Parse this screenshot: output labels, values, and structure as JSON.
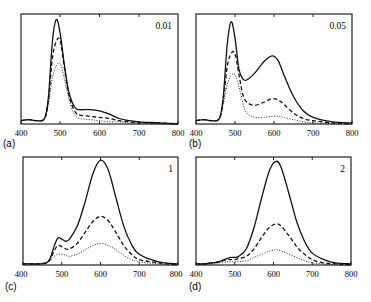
{
  "figure": {
    "panels": [
      {
        "id": "a",
        "label": "(a)",
        "annotation": "0.01"
      },
      {
        "id": "b",
        "label": "(b)",
        "annotation": "0.05"
      },
      {
        "id": "c",
        "label": "(c)",
        "annotation": "1"
      },
      {
        "id": "d",
        "label": "(d)",
        "annotation": "2"
      }
    ],
    "x_ticks": [
      "400",
      "500",
      "600",
      "700",
      "800"
    ]
  },
  "chart_data": [
    {
      "type": "line",
      "panel": "(a)",
      "title": "0.01",
      "xlabel": "",
      "ylabel": "",
      "xlim": [
        400,
        800
      ],
      "ylim": [
        0,
        1
      ],
      "x_ticks": [
        400,
        500,
        600,
        700,
        800
      ],
      "grid": false,
      "x": [
        400,
        420,
        440,
        460,
        470,
        480,
        490,
        500,
        510,
        520,
        530,
        540,
        550,
        575,
        600,
        625,
        650,
        675,
        700,
        750,
        800
      ],
      "series": [
        {
          "name": "solid",
          "style": "solid",
          "values": [
            0.03,
            0.04,
            0.03,
            0.05,
            0.25,
            0.75,
            0.95,
            0.82,
            0.55,
            0.32,
            0.2,
            0.14,
            0.13,
            0.13,
            0.12,
            0.09,
            0.05,
            0.03,
            0.02,
            0.01,
            0.0
          ]
        },
        {
          "name": "dashed",
          "style": "dashed",
          "values": [
            0.03,
            0.04,
            0.03,
            0.05,
            0.22,
            0.6,
            0.75,
            0.76,
            0.52,
            0.3,
            0.17,
            0.1,
            0.08,
            0.07,
            0.06,
            0.05,
            0.03,
            0.02,
            0.01,
            0.01,
            0.0
          ]
        },
        {
          "name": "dotted",
          "style": "dotted",
          "values": [
            0.03,
            0.04,
            0.03,
            0.05,
            0.18,
            0.42,
            0.53,
            0.55,
            0.42,
            0.26,
            0.13,
            0.07,
            0.05,
            0.04,
            0.03,
            0.02,
            0.02,
            0.01,
            0.01,
            0.0,
            0.0
          ]
        }
      ]
    },
    {
      "type": "line",
      "panel": "(b)",
      "title": "0.05",
      "xlabel": "",
      "ylabel": "",
      "xlim": [
        400,
        800
      ],
      "ylim": [
        0,
        1
      ],
      "x_ticks": [
        400,
        500,
        600,
        700,
        800
      ],
      "grid": false,
      "x": [
        400,
        420,
        440,
        460,
        470,
        480,
        490,
        500,
        510,
        520,
        530,
        550,
        575,
        595,
        610,
        625,
        650,
        675,
        700,
        750,
        800
      ],
      "series": [
        {
          "name": "solid",
          "style": "solid",
          "values": [
            0.03,
            0.04,
            0.03,
            0.05,
            0.25,
            0.72,
            0.93,
            0.78,
            0.5,
            0.41,
            0.4,
            0.46,
            0.57,
            0.62,
            0.58,
            0.45,
            0.25,
            0.12,
            0.06,
            0.02,
            0.01
          ]
        },
        {
          "name": "dashed",
          "style": "dashed",
          "values": [
            0.03,
            0.04,
            0.03,
            0.05,
            0.22,
            0.52,
            0.64,
            0.64,
            0.45,
            0.27,
            0.2,
            0.17,
            0.2,
            0.23,
            0.22,
            0.18,
            0.1,
            0.05,
            0.03,
            0.01,
            0.0
          ]
        },
        {
          "name": "dotted",
          "style": "dotted",
          "values": [
            0.03,
            0.04,
            0.03,
            0.05,
            0.18,
            0.36,
            0.44,
            0.45,
            0.34,
            0.19,
            0.1,
            0.06,
            0.06,
            0.07,
            0.07,
            0.06,
            0.04,
            0.02,
            0.01,
            0.0,
            0.0
          ]
        }
      ]
    },
    {
      "type": "line",
      "panel": "(c)",
      "title": "1",
      "xlabel": "",
      "ylabel": "",
      "xlim": [
        400,
        800
      ],
      "ylim": [
        0,
        1
      ],
      "x_ticks": [
        400,
        500,
        600,
        700,
        800
      ],
      "grid": false,
      "x": [
        400,
        420,
        440,
        460,
        470,
        480,
        490,
        500,
        510,
        520,
        540,
        560,
        580,
        600,
        620,
        640,
        660,
        680,
        700,
        750,
        800
      ],
      "series": [
        {
          "name": "solid",
          "style": "solid",
          "values": [
            0.01,
            0.01,
            0.01,
            0.02,
            0.06,
            0.17,
            0.25,
            0.24,
            0.22,
            0.24,
            0.36,
            0.58,
            0.84,
            0.97,
            0.88,
            0.62,
            0.36,
            0.19,
            0.1,
            0.03,
            0.01
          ]
        },
        {
          "name": "dashed",
          "style": "dashed",
          "values": [
            0.01,
            0.01,
            0.01,
            0.02,
            0.05,
            0.13,
            0.18,
            0.17,
            0.15,
            0.15,
            0.2,
            0.3,
            0.4,
            0.45,
            0.41,
            0.3,
            0.18,
            0.1,
            0.05,
            0.02,
            0.0
          ]
        },
        {
          "name": "dotted",
          "style": "dotted",
          "values": [
            0.01,
            0.01,
            0.01,
            0.02,
            0.04,
            0.08,
            0.1,
            0.1,
            0.09,
            0.08,
            0.1,
            0.14,
            0.18,
            0.2,
            0.18,
            0.14,
            0.09,
            0.05,
            0.03,
            0.01,
            0.0
          ]
        }
      ]
    },
    {
      "type": "line",
      "panel": "(d)",
      "title": "2",
      "xlabel": "",
      "ylabel": "",
      "xlim": [
        400,
        800
      ],
      "ylim": [
        0,
        1
      ],
      "x_ticks": [
        400,
        500,
        600,
        700,
        800
      ],
      "grid": false,
      "x": [
        400,
        420,
        440,
        460,
        480,
        490,
        500,
        510,
        530,
        550,
        570,
        590,
        607,
        620,
        640,
        660,
        680,
        700,
        730,
        760,
        800
      ],
      "series": [
        {
          "name": "solid",
          "style": "solid",
          "values": [
            0.01,
            0.01,
            0.02,
            0.03,
            0.06,
            0.07,
            0.07,
            0.08,
            0.15,
            0.35,
            0.63,
            0.88,
            0.96,
            0.9,
            0.66,
            0.4,
            0.22,
            0.11,
            0.05,
            0.02,
            0.01
          ]
        },
        {
          "name": "dashed",
          "style": "dashed",
          "values": [
            0.01,
            0.01,
            0.02,
            0.03,
            0.05,
            0.05,
            0.05,
            0.06,
            0.08,
            0.15,
            0.26,
            0.35,
            0.38,
            0.36,
            0.27,
            0.17,
            0.1,
            0.05,
            0.02,
            0.01,
            0.0
          ]
        },
        {
          "name": "dotted",
          "style": "dotted",
          "values": [
            0.01,
            0.01,
            0.01,
            0.02,
            0.03,
            0.03,
            0.03,
            0.03,
            0.04,
            0.07,
            0.1,
            0.13,
            0.14,
            0.13,
            0.1,
            0.07,
            0.04,
            0.02,
            0.01,
            0.0,
            0.0
          ]
        }
      ]
    }
  ]
}
